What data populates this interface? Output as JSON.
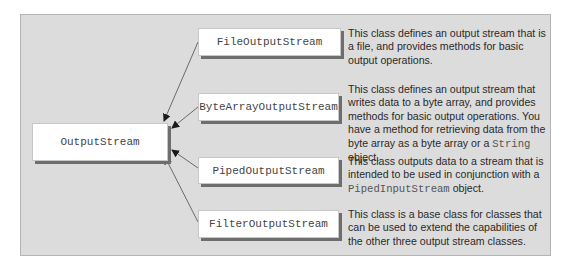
{
  "diagram": {
    "root": {
      "label": "OutputStream"
    },
    "subclasses": [
      {
        "label": "FileOutputStream",
        "description": "This class defines an output stream that is a file, and provides methods for basic output operations."
      },
      {
        "label": "ByteArrayOutputStream",
        "description_pre": "This class defines an output stream that writes data to a byte array, and provides methods for basic output operations. You have a method for retrieving data from the byte array as a byte array or a ",
        "description_code": "String",
        "description_post": " object."
      },
      {
        "label": "PipedOutputStream",
        "description_pre": "This class outputs data to a stream that is intended to be used in conjunction with a ",
        "description_code": "PipedInputStream",
        "description_post": " object."
      },
      {
        "label": "FilterOutputStream",
        "description": "This class is a base class for classes that can be used to extend the capabilities of the other three output stream classes."
      }
    ],
    "colors": {
      "panel_bg": "#dcdcdc",
      "box_bg": "#ffffff",
      "box_shadow": "#6e6e6e",
      "arrow": "#6a6a6a"
    }
  }
}
